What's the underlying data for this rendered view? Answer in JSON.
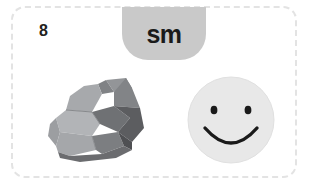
{
  "card": {
    "item_number": "8",
    "border_color": "#e3e3e3",
    "background_color": "#ffffff"
  },
  "syllable_tab": {
    "label": "sm",
    "background_color": "#c9c9c9",
    "text_color": "#1a1a1a"
  },
  "choices": [
    {
      "name": "rock",
      "icon": "rock-image",
      "colors": {
        "light": "#a7a9ac",
        "mid": "#939598",
        "dark": "#6d6e71",
        "darkest": "#58595b",
        "highlight": "#bcbec0"
      }
    },
    {
      "name": "smiley",
      "icon": "smiley-face-image",
      "colors": {
        "face": "#e8e8e8",
        "face_edge": "#dedede",
        "features": "#1a1a1a"
      }
    }
  ]
}
